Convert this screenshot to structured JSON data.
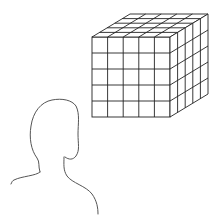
{
  "figure": {
    "cube": {
      "grid_size": 5,
      "stroke_color": "#222222"
    },
    "person": {
      "stroke_color": "#555555"
    },
    "background": "#ffffff"
  },
  "caption": {
    "text": ""
  }
}
